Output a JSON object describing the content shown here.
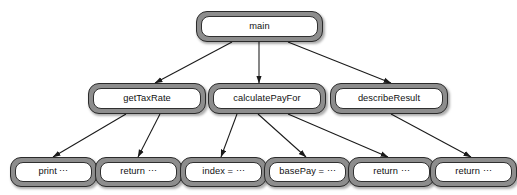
{
  "diagram": {
    "type": "call-tree",
    "background_color": "#ffffff",
    "node_shell_color": "#8d8d8d",
    "node_fill_color": "#ffffff",
    "node_border_color": "#2b2b2b",
    "edge_color": "#1a1a1a",
    "levels": 3,
    "nodes": {
      "main": {
        "label": "main"
      },
      "get_tax_rate": {
        "label": "getTaxRate"
      },
      "calculate_pay_for": {
        "label": "calculatePayFor"
      },
      "describe_result": {
        "label": "describeResult"
      },
      "leaf_print": {
        "label": "print ⋯"
      },
      "leaf_return_1": {
        "label": "return ⋯"
      },
      "leaf_index": {
        "label": "index = ⋯"
      },
      "leaf_base_pay": {
        "label": "basePay = ⋯"
      },
      "leaf_return_2": {
        "label": "return ⋯"
      },
      "leaf_return_3": {
        "label": "return ⋯"
      }
    },
    "edges": [
      {
        "from": "main",
        "to": "get_tax_rate"
      },
      {
        "from": "main",
        "to": "calculate_pay_for"
      },
      {
        "from": "main",
        "to": "describe_result"
      },
      {
        "from": "get_tax_rate",
        "to": "leaf_print"
      },
      {
        "from": "get_tax_rate",
        "to": "leaf_return_1"
      },
      {
        "from": "calculate_pay_for",
        "to": "leaf_index"
      },
      {
        "from": "calculate_pay_for",
        "to": "leaf_base_pay"
      },
      {
        "from": "calculate_pay_for",
        "to": "leaf_return_2"
      },
      {
        "from": "describe_result",
        "to": "leaf_return_3"
      }
    ]
  }
}
